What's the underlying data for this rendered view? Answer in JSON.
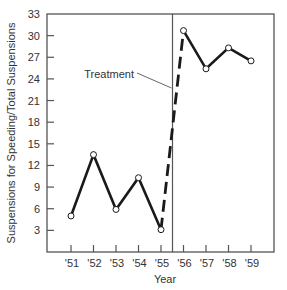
{
  "chart_data": {
    "type": "line",
    "title": "",
    "xlabel": "Year",
    "ylabel": "Suspensions for Speeding/Total Suspensions",
    "x": [
      "'51",
      "'52",
      "'53",
      "'54",
      "'55",
      "'56",
      "'57",
      "'58",
      "'59"
    ],
    "series": [
      {
        "name": "Suspensions ratio",
        "values": [
          5.0,
          13.5,
          5.9,
          10.3,
          3.1,
          30.7,
          25.4,
          28.3,
          26.5
        ]
      }
    ],
    "y_ticks": [
      3,
      6,
      9,
      12,
      15,
      18,
      21,
      24,
      27,
      30,
      33
    ],
    "ylim": [
      0,
      33
    ],
    "grid": false,
    "legend": "none",
    "annotations": [
      {
        "text": "Treatment",
        "type": "vertical-line",
        "x_between": [
          "'55",
          "'56"
        ]
      }
    ],
    "segment_styles": [
      {
        "from": "'55",
        "to": "'56",
        "style": "dashed"
      }
    ]
  },
  "labels": {
    "xlabel": "Year",
    "ylabel": "Suspensions for Speeding/Total Suspensions",
    "treatment": "Treatment"
  },
  "colors": {
    "line": "#1a1a1a",
    "axis": "#555555",
    "marker_fill": "#ffffff"
  }
}
